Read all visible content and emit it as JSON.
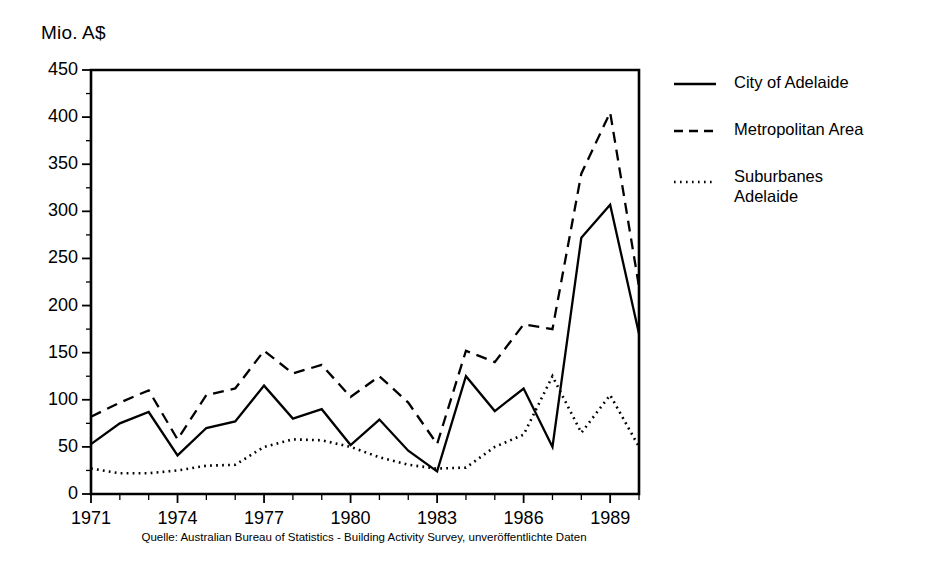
{
  "figure": {
    "y_axis_title": "Mio. A$",
    "caption": "Quelle: Australian Bureau of Statistics - Building Activity Survey, unveröffentlichte Daten"
  },
  "legend": {
    "items": [
      {
        "label": "City of Adelaide",
        "style": "solid",
        "key_icon": "solid-line-icon"
      },
      {
        "label": "Metropolitan Area",
        "style": "dashed",
        "key_icon": "dashed-line-icon"
      },
      {
        "label": "Suburbanes\nAdelaide",
        "style": "dotted",
        "key_icon": "dotted-line-icon"
      }
    ]
  },
  "chart_data": {
    "type": "line",
    "title": "",
    "subtitle": "",
    "xlabel": "",
    "ylabel": "Mio. A$",
    "xlim": [
      1971,
      1990
    ],
    "ylim": [
      0,
      450
    ],
    "ytick_step": 50,
    "yminor_step": 25,
    "grid": false,
    "legend_position": "right",
    "x": [
      1971,
      1972,
      1973,
      1974,
      1975,
      1976,
      1977,
      1978,
      1979,
      1980,
      1981,
      1982,
      1983,
      1984,
      1985,
      1986,
      1987,
      1988,
      1989,
      1990
    ],
    "xticks": [
      1971,
      1974,
      1977,
      1980,
      1983,
      1986,
      1989
    ],
    "xtick_labels": [
      "1971",
      "1974",
      "1977",
      "1980",
      "1983",
      "1986",
      "1989"
    ],
    "yticks": [
      0,
      50,
      100,
      150,
      200,
      250,
      300,
      350,
      400,
      450
    ],
    "ytick_labels": [
      "0",
      "50",
      "100",
      "150",
      "200",
      "250",
      "300",
      "350",
      "400",
      "450"
    ],
    "series": [
      {
        "name": "City of Adelaide",
        "style": "solid",
        "values": [
          53,
          75,
          87,
          41,
          70,
          77,
          115,
          80,
          90,
          52,
          79,
          46,
          24,
          125,
          88,
          112,
          50,
          272,
          307,
          170
        ]
      },
      {
        "name": "Metropolitan Area",
        "style": "dashed",
        "values": [
          82,
          97,
          110,
          58,
          105,
          112,
          152,
          128,
          137,
          103,
          125,
          97,
          53,
          152,
          140,
          180,
          175,
          340,
          405,
          220
        ]
      },
      {
        "name": "Suburbanes Adelaide",
        "style": "dotted",
        "values": [
          27,
          22,
          22,
          25,
          30,
          31,
          50,
          58,
          57,
          50,
          39,
          31,
          27,
          28,
          50,
          63,
          125,
          65,
          105,
          50
        ]
      }
    ]
  }
}
